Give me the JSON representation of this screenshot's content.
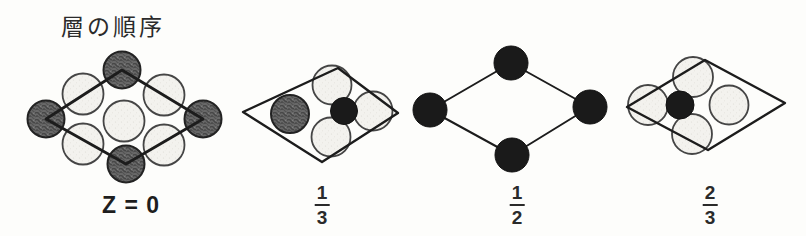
{
  "title": "層の順序",
  "background": "#fdfdfb",
  "ink": "#1c1c1c",
  "atom_styles": {
    "light": {
      "fill": "#f3f2ee",
      "stroke": "#454545"
    },
    "dark": {
      "fill": "#686868",
      "stroke": "#222222"
    },
    "black": {
      "fill": "#1a1a1a",
      "stroke": "#111111"
    }
  },
  "diagrams": [
    {
      "id": "z0",
      "label": "Z = 0",
      "line_width": 2.8,
      "rhombus": [
        [
          46,
          119
        ],
        [
          122,
          70
        ],
        [
          203,
          119
        ],
        [
          126,
          164
        ]
      ],
      "atoms_under": [
        {
          "kind": "light",
          "x": 83,
          "y": 94,
          "r": 20.5
        },
        {
          "kind": "light",
          "x": 164,
          "y": 95,
          "r": 20.5
        },
        {
          "kind": "light",
          "x": 124,
          "y": 121,
          "r": 20.5
        },
        {
          "kind": "light",
          "x": 83,
          "y": 144,
          "r": 20.5
        },
        {
          "kind": "light",
          "x": 164,
          "y": 145,
          "r": 20.5
        },
        {
          "kind": "dark",
          "x": 46,
          "y": 119,
          "r": 18.5
        },
        {
          "kind": "dark",
          "x": 122,
          "y": 70,
          "r": 18.5
        },
        {
          "kind": "dark",
          "x": 203,
          "y": 119,
          "r": 18.5
        },
        {
          "kind": "dark",
          "x": 126,
          "y": 164,
          "r": 18.5
        }
      ],
      "atoms_over": []
    },
    {
      "id": "one-third",
      "label_numerator": "1",
      "label_denominator": "3",
      "line_width": 2.4,
      "rhombus": [
        [
          243,
          112
        ],
        [
          338,
          68
        ],
        [
          398,
          113
        ],
        [
          322,
          162
        ]
      ],
      "atoms_under": [
        {
          "kind": "light",
          "x": 332,
          "y": 85,
          "r": 19.5
        },
        {
          "kind": "light",
          "x": 373,
          "y": 111,
          "r": 19.5
        },
        {
          "kind": "light",
          "x": 331,
          "y": 137,
          "r": 19.5
        },
        {
          "kind": "dark",
          "x": 290,
          "y": 114,
          "r": 19
        }
      ],
      "atoms_over": [
        {
          "kind": "black",
          "x": 344,
          "y": 111,
          "r": 13.5
        }
      ]
    },
    {
      "id": "one-half",
      "label_numerator": "1",
      "label_denominator": "2",
      "line_width": 2,
      "rhombus": [
        [
          430,
          110
        ],
        [
          511,
          63
        ],
        [
          590,
          107
        ],
        [
          512,
          155
        ]
      ],
      "atoms_under": [],
      "atoms_over": [
        {
          "kind": "black",
          "x": 430,
          "y": 110,
          "r": 17
        },
        {
          "kind": "black",
          "x": 511,
          "y": 63,
          "r": 17
        },
        {
          "kind": "black",
          "x": 590,
          "y": 107,
          "r": 17
        },
        {
          "kind": "black",
          "x": 512,
          "y": 155,
          "r": 17
        }
      ]
    },
    {
      "id": "two-thirds",
      "label_numerator": "2",
      "label_denominator": "3",
      "line_width": 2.4,
      "rhombus": [
        [
          627,
          107
        ],
        [
          705,
          60
        ],
        [
          785,
          103
        ],
        [
          708,
          150
        ]
      ],
      "atoms_under": [
        {
          "kind": "light",
          "x": 693,
          "y": 77,
          "r": 20
        },
        {
          "kind": "light",
          "x": 648,
          "y": 105,
          "r": 20
        },
        {
          "kind": "light",
          "x": 692,
          "y": 134,
          "r": 20
        },
        {
          "kind": "light",
          "x": 729,
          "y": 105,
          "r": 19.5
        }
      ],
      "atoms_over": [
        {
          "kind": "black",
          "x": 680,
          "y": 105,
          "r": 14
        }
      ]
    }
  ]
}
